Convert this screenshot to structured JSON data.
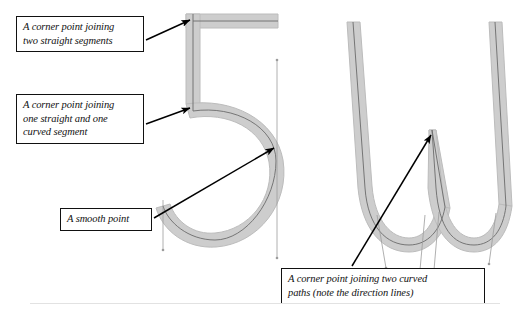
{
  "figure": {
    "background_color": "#ffffff",
    "stroke_band_color": "#cccccc",
    "stroke_band_edge_color": "#bdbdbd",
    "path_line_color": "#555555",
    "direction_line_color": "#999999",
    "annotation_border_color": "#111111",
    "annotation_text_color": "#111111",
    "arrow_color": "#000000"
  },
  "callouts": [
    {
      "id": "corner-straight",
      "text": "A corner point joining\ntwo straight segments",
      "points_at": "top-left corner of the numeral 5"
    },
    {
      "id": "corner-mixed",
      "text": "A corner point joining\none straight and one\ncurved segment",
      "points_at": "junction of vertical stem and bowl of the numeral 5"
    },
    {
      "id": "smooth",
      "text": "A smooth point",
      "points_at": "right side of the bowl of the numeral 5"
    },
    {
      "id": "corner-curved",
      "text": "A corner point joining two curved\npaths (note the direction lines)",
      "points_at": "middle apex of the letter w"
    }
  ],
  "glyphs": [
    {
      "id": "numeral-5",
      "character": "5"
    },
    {
      "id": "letter-w",
      "character": "w"
    }
  ],
  "anchor_points": [
    {
      "glyph": "numeral-5",
      "type": "corner",
      "label": "top-left corner"
    },
    {
      "glyph": "numeral-5",
      "type": "corner",
      "label": "stem-to-bowl junction"
    },
    {
      "glyph": "numeral-5",
      "type": "smooth",
      "label": "bowl right side"
    },
    {
      "glyph": "letter-w",
      "type": "corner",
      "label": "middle apex"
    }
  ]
}
